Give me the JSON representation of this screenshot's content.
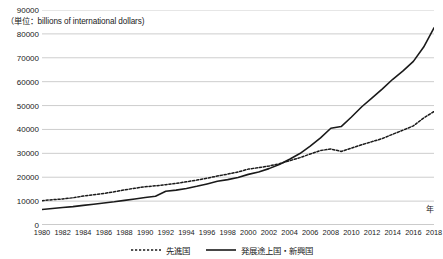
{
  "chart_data": {
    "type": "line",
    "title": "",
    "unit_note": "（単位：billions of international dollars)",
    "xlabel": "年",
    "ylabel": "",
    "xlim": [
      1980,
      2018
    ],
    "ylim": [
      0,
      90000
    ],
    "grid": true,
    "legend_position": "bottom",
    "y_ticks": [
      0,
      10000,
      20000,
      30000,
      40000,
      50000,
      60000,
      70000,
      80000,
      90000
    ],
    "y_tick_labels": [
      "0",
      "10000",
      "20000",
      "30000",
      "40000",
      "50000",
      "60000",
      "70000",
      "80000",
      "90000"
    ],
    "x_ticks": [
      1980,
      1982,
      1984,
      1986,
      1988,
      1990,
      1992,
      1994,
      1996,
      1998,
      2000,
      2002,
      2004,
      2006,
      2008,
      2010,
      2012,
      2014,
      2016,
      2018
    ],
    "x_tick_labels": [
      "1980",
      "1982",
      "1984",
      "1986",
      "1988",
      "1990",
      "1992",
      "1994",
      "1996",
      "1998",
      "2000",
      "2002",
      "2004",
      "2006",
      "2008",
      "2010",
      "2012",
      "2014",
      "2016",
      "2018"
    ],
    "x": [
      1980,
      1981,
      1982,
      1983,
      1984,
      1985,
      1986,
      1987,
      1988,
      1989,
      1990,
      1991,
      1992,
      1993,
      1994,
      1995,
      1996,
      1997,
      1998,
      1999,
      2000,
      2001,
      2002,
      2003,
      2004,
      2005,
      2006,
      2007,
      2008,
      2009,
      2010,
      2011,
      2012,
      2013,
      2014,
      2015,
      2016,
      2017,
      2018
    ],
    "series": [
      {
        "name": "先進国",
        "style": "dotted",
        "color": "#1a1a1a",
        "values": [
          10200,
          10600,
          10900,
          11400,
          12100,
          12700,
          13200,
          13900,
          14700,
          15400,
          16000,
          16400,
          16900,
          17400,
          18100,
          18800,
          19600,
          20500,
          21300,
          22200,
          23400,
          24000,
          24700,
          25600,
          26900,
          28200,
          29700,
          31200,
          31800,
          30800,
          32200,
          33600,
          34900,
          36200,
          38000,
          39700,
          41500,
          44800,
          47500
        ]
      },
      {
        "name": "発展途上国・新興国",
        "style": "solid",
        "color": "#1a1a1a",
        "values": [
          6500,
          6900,
          7300,
          7700,
          8200,
          8700,
          9200,
          9700,
          10300,
          10900,
          11500,
          12000,
          14100,
          14600,
          15300,
          16200,
          17200,
          18300,
          19000,
          19900,
          21200,
          22200,
          23600,
          25300,
          27500,
          29900,
          33000,
          36500,
          40500,
          41200,
          45200,
          49500,
          53200,
          57000,
          61000,
          64500,
          68500,
          74500,
          82500
        ]
      }
    ]
  },
  "legend": {
    "items": [
      {
        "label": "先進国",
        "style": "dotted"
      },
      {
        "label": "発展途上国・新興国",
        "style": "solid"
      }
    ]
  }
}
